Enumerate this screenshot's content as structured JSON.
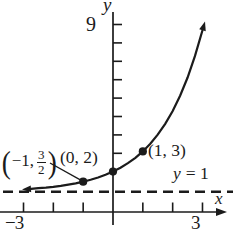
{
  "figure": {
    "background": "#ffffff",
    "ink_color": "#1b1b1b"
  },
  "chart_data": {
    "type": "line",
    "title": "",
    "xlabel": "x",
    "ylabel": "y",
    "xlim": [
      -3,
      3
    ],
    "ylim": [
      0,
      9
    ],
    "grid": false,
    "x_ticks": [
      -3,
      -2,
      -1,
      1,
      2,
      3
    ],
    "x_tick_labels_shown": [
      "-3",
      "3"
    ],
    "y_ticks": [
      2,
      3,
      4,
      5,
      6,
      7,
      8,
      9
    ],
    "y_tick_labels_shown": [
      "9"
    ],
    "asymptote": {
      "y": 1,
      "label": "y = 1",
      "style": "dashed"
    },
    "labeled_points": [
      {
        "x": -1,
        "y": 1.5,
        "label": "(-1, 3/2)"
      },
      {
        "x": 0,
        "y": 2,
        "label": "(0, 2)"
      },
      {
        "x": 1,
        "y": 3,
        "label": "(1, 3)"
      }
    ],
    "series": [
      {
        "name": "exponential curve through labeled points",
        "x": [
          -2.75,
          -2.5,
          -2.25,
          -2,
          -1.75,
          -1.5,
          -1.25,
          -1,
          -0.75,
          -0.5,
          -0.25,
          0,
          0.25,
          0.5,
          0.75,
          1,
          1.25,
          1.5,
          1.75,
          2,
          2.25,
          2.5,
          2.75,
          3
        ],
        "y": [
          1.149,
          1.177,
          1.21,
          1.25,
          1.297,
          1.354,
          1.42,
          1.5,
          1.595,
          1.707,
          1.841,
          2.0,
          2.189,
          2.414,
          2.682,
          3.0,
          3.378,
          3.828,
          4.364,
          5.0,
          5.757,
          6.657,
          7.727,
          9.0
        ]
      }
    ],
    "arrows": [
      "curve-left-end",
      "curve-right-end",
      "x-axis-right-end"
    ]
  },
  "labels": {
    "y_axis_title": "y",
    "x_axis_title": "x",
    "y_max_tick": "9",
    "x_min_tick": "−3",
    "x_max_tick": "3",
    "asymptote": {
      "var": "y",
      "rest": "= 1"
    },
    "point_neg1": {
      "open": "(",
      "xval": "−1,",
      "num": "3",
      "den": "2",
      "close": ")"
    },
    "point_origin": "(0, 2)",
    "point_one": "(1, 3)"
  }
}
